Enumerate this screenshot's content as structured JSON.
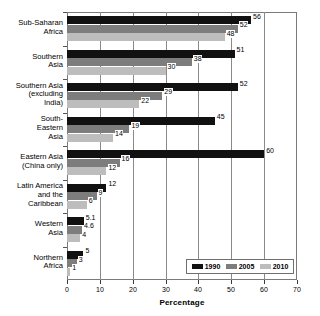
{
  "chart_data": {
    "type": "bar",
    "orientation": "horizontal",
    "title": "",
    "xlabel": "Percentage",
    "ylabel": "",
    "xlim": [
      0,
      70
    ],
    "xticks": [
      0,
      10,
      20,
      30,
      40,
      50,
      60,
      70
    ],
    "grid": true,
    "legend_position": "bottom-right",
    "categories": [
      "Sub-Saharan Africa",
      "Southern Asia",
      "Southern Asia (excluding India)",
      "South-Eastern Asia",
      "Eastern Asia (China only)",
      "Latin America and the Caribbean",
      "Western Asia",
      "Northern Africa"
    ],
    "category_lines": [
      [
        "Sub-Saharan",
        "Africa"
      ],
      [
        "Southern",
        "Asia"
      ],
      [
        "Southern Asia",
        "(excluding",
        "India)"
      ],
      [
        "South-",
        "Eastern",
        "Asia"
      ],
      [
        "Eastern Asia",
        "(China only)"
      ],
      [
        "Latin America",
        "and the",
        "Caribbean"
      ],
      [
        "Western",
        "Asia"
      ],
      [
        "Northern",
        "Africa"
      ]
    ],
    "series": [
      {
        "name": "1990",
        "color": "#111111",
        "values": [
          56,
          51,
          52,
          45,
          60,
          12,
          5.1,
          5
        ],
        "labels": [
          "56",
          "51",
          "52",
          "45",
          "60",
          "12",
          "5.1",
          "5"
        ]
      },
      {
        "name": "2005",
        "color": "#7d7d7d",
        "values": [
          52,
          38,
          29,
          19,
          16,
          9,
          4.6,
          3
        ],
        "labels": [
          "52",
          "38",
          "29",
          "19",
          "16",
          "9",
          "4.6",
          "3"
        ]
      },
      {
        "name": "2010",
        "color": "#bdbdbd",
        "values": [
          48,
          30,
          22,
          14,
          12,
          6,
          4,
          1
        ],
        "labels": [
          "48",
          "30",
          "22",
          "14",
          "12",
          "6",
          "4",
          "1"
        ]
      }
    ]
  },
  "legend": {
    "items": [
      {
        "label": "1990",
        "color": "#111111"
      },
      {
        "label": "2005",
        "color": "#7d7d7d"
      },
      {
        "label": "2010",
        "color": "#bdbdbd"
      }
    ]
  },
  "axis": {
    "x_title": "Percentage",
    "tick_labels": [
      "0",
      "10",
      "20",
      "30",
      "40",
      "50",
      "60",
      "70"
    ]
  }
}
